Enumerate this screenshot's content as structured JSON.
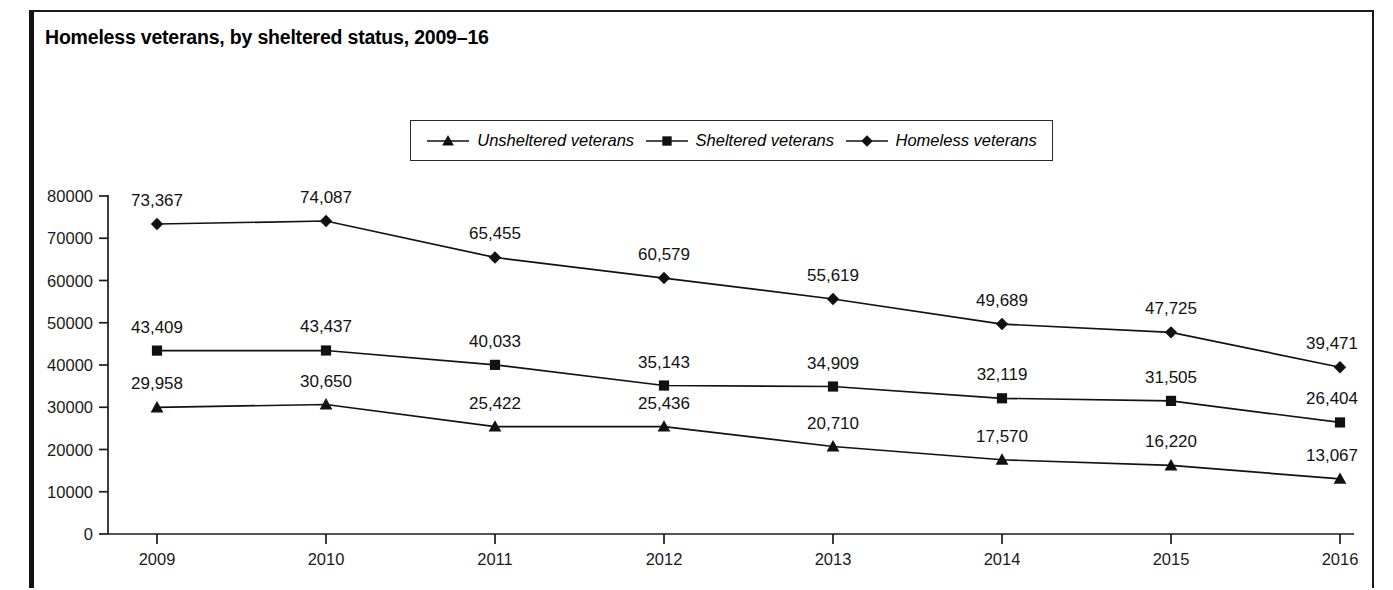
{
  "figure": {
    "title": "Homeless veterans, by sheltered status, 2009–16"
  },
  "legend": {
    "entries": [
      {
        "label": "Unsheltered veterans",
        "marker": "triangle-marker"
      },
      {
        "label": "Sheltered veterans",
        "marker": "square-marker"
      },
      {
        "label": "Homeless veterans",
        "marker": "diamond-marker"
      }
    ]
  },
  "axes": {
    "y_tick_labels": [
      "80000",
      "70000",
      "60000",
      "50000",
      "40000",
      "30000",
      "20000",
      "10000",
      "0"
    ],
    "x_tick_labels": [
      "2009",
      "2010",
      "2011",
      "2012",
      "2013",
      "2014",
      "2015",
      "2016"
    ]
  },
  "chart_data": {
    "type": "line",
    "title": "Homeless veterans, by sheltered status, 2009–16",
    "xlabel": "",
    "ylabel": "",
    "ylim": [
      0,
      80000
    ],
    "ytick_step": 10000,
    "grid": false,
    "legend_position": "top-center",
    "categories": [
      "2009",
      "2010",
      "2011",
      "2012",
      "2013",
      "2014",
      "2015",
      "2016"
    ],
    "series": [
      {
        "name": "Homeless veterans",
        "marker": "diamond",
        "values": [
          73367,
          74087,
          65455,
          60579,
          55619,
          49689,
          47725,
          39471
        ],
        "labels": [
          "73,367",
          "74,087",
          "65,455",
          "60,579",
          "55,619",
          "49,689",
          "47,725",
          "39,471"
        ]
      },
      {
        "name": "Sheltered veterans",
        "marker": "square",
        "values": [
          43409,
          43437,
          40033,
          35143,
          34909,
          32119,
          31505,
          26404
        ],
        "labels": [
          "43,409",
          "43,437",
          "40,033",
          "35,143",
          "34,909",
          "32,119",
          "31,505",
          "26,404"
        ]
      },
      {
        "name": "Unsheltered veterans",
        "marker": "triangle",
        "values": [
          29958,
          30650,
          25422,
          25436,
          20710,
          17570,
          16220,
          13067
        ],
        "labels": [
          "29,958",
          "30,650",
          "25,422",
          "25,436",
          "20,710",
          "17,570",
          "16,220",
          "13,067"
        ]
      }
    ]
  },
  "colors": {
    "ink": "#111111",
    "background": "#ffffff"
  }
}
